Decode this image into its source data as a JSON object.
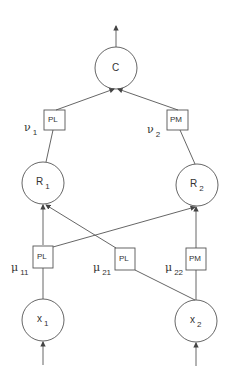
{
  "diagram": {
    "type": "neural-network-structure",
    "nodes": {
      "C": {
        "label": "C",
        "sub": ""
      },
      "R1": {
        "label": "R",
        "sub": "1"
      },
      "R2": {
        "label": "R",
        "sub": "2"
      },
      "X1": {
        "label": "x",
        "sub": "1"
      },
      "X2": {
        "label": "x",
        "sub": "2"
      }
    },
    "boxes": {
      "v1": {
        "label": "PL",
        "param": "ν",
        "param_sub": "1"
      },
      "v2": {
        "label": "PM",
        "param": "ν",
        "param_sub": "2"
      },
      "mu11": {
        "label": "PL",
        "param": "μ",
        "param_sub": "11"
      },
      "mu21": {
        "label": "PL",
        "param": "μ",
        "param_sub": "21"
      },
      "mu22": {
        "label": "PM",
        "param": "μ",
        "param_sub": "22"
      }
    },
    "edges": [
      {
        "from": "X1",
        "to": "mu11"
      },
      {
        "from": "mu11",
        "to": "R1"
      },
      {
        "from": "mu11",
        "to": "R2"
      },
      {
        "from": "X2",
        "to": "mu21"
      },
      {
        "from": "mu21",
        "to": "R1"
      },
      {
        "from": "X2",
        "to": "mu22"
      },
      {
        "from": "mu22",
        "to": "R2"
      },
      {
        "from": "R1",
        "to": "v1"
      },
      {
        "from": "v1",
        "to": "C"
      },
      {
        "from": "R2",
        "to": "v2"
      },
      {
        "from": "v2",
        "to": "C"
      }
    ],
    "colors": {
      "stroke": "#555555",
      "text": "#333333",
      "background": "#ffffff"
    }
  }
}
